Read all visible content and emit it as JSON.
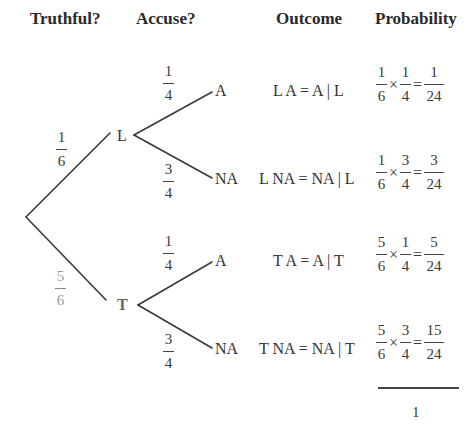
{
  "headers": {
    "truthful": "Truthful?",
    "accuse": "Accuse?",
    "outcome": "Outcome",
    "probability": "Probability"
  },
  "first_level": {
    "L": {
      "label": "L",
      "prob": {
        "num": "1",
        "den": "6"
      }
    },
    "T": {
      "label": "T",
      "prob": {
        "num": "5",
        "den": "6"
      }
    }
  },
  "second_level": {
    "L_A": {
      "label": "A",
      "prob": {
        "num": "1",
        "den": "4"
      }
    },
    "L_NA": {
      "label": "NA",
      "prob": {
        "num": "3",
        "den": "4"
      }
    },
    "T_A": {
      "label": "A",
      "prob": {
        "num": "1",
        "den": "4"
      }
    },
    "T_NA": {
      "label": "NA",
      "prob": {
        "num": "3",
        "den": "4"
      }
    }
  },
  "outcomes": [
    {
      "text": "L A = A | L",
      "p1": {
        "num": "1",
        "den": "6"
      },
      "p2": {
        "num": "1",
        "den": "4"
      },
      "result": {
        "num": "1",
        "den": "24"
      }
    },
    {
      "text": "L NA = NA | L",
      "p1": {
        "num": "1",
        "den": "6"
      },
      "p2": {
        "num": "3",
        "den": "4"
      },
      "result": {
        "num": "3",
        "den": "24"
      }
    },
    {
      "text": "T A = A | T",
      "p1": {
        "num": "5",
        "den": "6"
      },
      "p2": {
        "num": "1",
        "den": "4"
      },
      "result": {
        "num": "5",
        "den": "24"
      }
    },
    {
      "text": "T NA = NA | T",
      "p1": {
        "num": "5",
        "den": "6"
      },
      "p2": {
        "num": "3",
        "den": "4"
      },
      "result": {
        "num": "15",
        "den": "24"
      }
    }
  ],
  "operators": {
    "times": "×",
    "equals": "="
  },
  "total": "1"
}
